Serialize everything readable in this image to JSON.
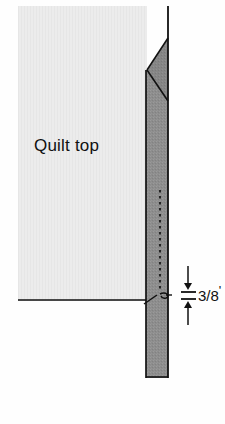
{
  "figure": {
    "type": "sewing-diagram",
    "title_text": "Quilt top",
    "dimension": {
      "numerator": "3",
      "slash": "/",
      "denominator": "8",
      "unit_mark": "'",
      "full_text": "3/8'"
    },
    "colors": {
      "background": "#fefefe",
      "quilt_top_fill": "#ececec",
      "binding_fill": "#8d8d8d",
      "binding_fold_fill": "#7e7e7e",
      "outline": "#111111",
      "stitch_line": "#111111",
      "text": "#111111"
    },
    "parts": [
      {
        "name": "quilt-top-panel",
        "label": "Quilt top"
      },
      {
        "name": "binding-strip",
        "label": ""
      },
      {
        "name": "mitered-fold",
        "label": ""
      },
      {
        "name": "stitch-line",
        "label": ""
      },
      {
        "name": "needle-loop",
        "label": ""
      },
      {
        "name": "dimension-arrow",
        "label": "3/8'"
      }
    ]
  }
}
